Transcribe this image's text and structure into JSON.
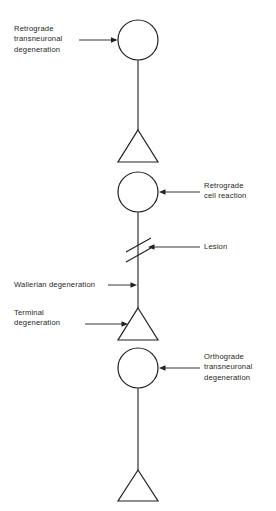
{
  "figure": {
    "background_color": "#ffffff",
    "stroke_color": "#231f20",
    "text_color": "#231f20",
    "labels": {
      "retrograde_transneuronal_degeneration": "Retrograde\ntransneuronal\ndegeneration",
      "retrograde_cell_reaction": "Retrograde\ncell reaction",
      "lesion": "Lesion",
      "wallerian_degeneration": "Wallerian degeneration",
      "terminal_degeneration": "Terminal\ndegeneration",
      "orthograde_transneuronal_degeneration": "Orthograde\ntransneuronal\ndegeneration"
    },
    "elements": {
      "neuron_1_soma": "cell-body-circle",
      "neuron_1_axon": "axon-line",
      "neuron_1_terminal": "axon-terminal-triangle",
      "neuron_2_soma": "cell-body-circle",
      "neuron_2_axon": "axon-line",
      "neuron_2_lesion_mark": "double-slash-lesion-mark",
      "neuron_2_terminal": "axon-terminal-triangle",
      "neuron_3_soma": "cell-body-circle",
      "neuron_3_axon": "axon-line",
      "neuron_3_terminal": "axon-terminal-triangle"
    }
  }
}
